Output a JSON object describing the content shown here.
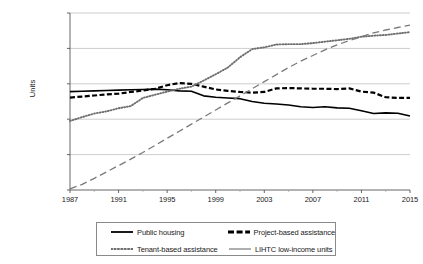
{
  "chart_data": {
    "type": "line",
    "title": "",
    "xlabel": "",
    "ylabel": "Units",
    "xlim": [
      1987,
      2015
    ],
    "ylim": [
      0,
      2500000
    ],
    "grid": "horizontal",
    "legend_position": "bottom",
    "y_ticks": [
      "0",
      "500,000",
      "1,000,000",
      "1,500,000",
      "2,000,000",
      "2,500,000"
    ],
    "y_tick_values": [
      0,
      500000,
      1000000,
      1500000,
      2000000,
      2500000
    ],
    "x_ticks": [
      "1987",
      "1991",
      "1995",
      "1999",
      "2003",
      "2007",
      "2011",
      "2015"
    ],
    "x_tick_values": [
      1987,
      1991,
      1995,
      1999,
      2003,
      2007,
      2011,
      2015
    ],
    "x_minor_tick_values": [
      1989,
      1993,
      1997,
      2001,
      2005,
      2009,
      2013
    ],
    "x": [
      1987,
      1988,
      1989,
      1990,
      1991,
      1992,
      1993,
      1994,
      1995,
      1996,
      1997,
      1998,
      1999,
      2000,
      2001,
      2002,
      2003,
      2004,
      2005,
      2006,
      2007,
      2008,
      2009,
      2010,
      2011,
      2012,
      2013,
      2014,
      2015
    ],
    "series": [
      {
        "name": "Public housing",
        "style": "solid",
        "color": "#000000",
        "values": [
          1390000,
          1395000,
          1400000,
          1405000,
          1410000,
          1415000,
          1420000,
          1425000,
          1415000,
          1400000,
          1395000,
          1330000,
          1310000,
          1300000,
          1290000,
          1250000,
          1225000,
          1215000,
          1200000,
          1175000,
          1165000,
          1175000,
          1160000,
          1155000,
          1120000,
          1080000,
          1090000,
          1085000,
          1045000
        ]
      },
      {
        "name": "Project-based assistance",
        "style": "dashed",
        "color": "#000000",
        "values": [
          1305000,
          1320000,
          1335000,
          1350000,
          1360000,
          1385000,
          1405000,
          1430000,
          1480000,
          1510000,
          1500000,
          1460000,
          1420000,
          1400000,
          1385000,
          1375000,
          1385000,
          1435000,
          1440000,
          1435000,
          1430000,
          1430000,
          1425000,
          1435000,
          1390000,
          1375000,
          1310000,
          1300000,
          1300000
        ]
      },
      {
        "name": "Tenant-based assistance",
        "style": "dotted",
        "color": "#6e6e6e",
        "values": [
          975000,
          1030000,
          1080000,
          1110000,
          1155000,
          1185000,
          1300000,
          1345000,
          1390000,
          1430000,
          1460000,
          1545000,
          1635000,
          1730000,
          1875000,
          1990000,
          2015000,
          2055000,
          2060000,
          2060000,
          2075000,
          2095000,
          2115000,
          2135000,
          2165000,
          2180000,
          2190000,
          2210000,
          2230000
        ]
      },
      {
        "name": "LIHTC low-income units",
        "style": "longdash",
        "color": "#7a7a7a",
        "values": [
          15000,
          80000,
          165000,
          255000,
          345000,
          435000,
          530000,
          630000,
          730000,
          830000,
          930000,
          1030000,
          1130000,
          1230000,
          1330000,
          1430000,
          1530000,
          1630000,
          1730000,
          1820000,
          1900000,
          1980000,
          2050000,
          2110000,
          2165000,
          2220000,
          2260000,
          2295000,
          2330000
        ]
      }
    ]
  },
  "legend": {
    "items": [
      {
        "label": "Public housing"
      },
      {
        "label": "Project-based assistance"
      },
      {
        "label": "Tenant-based assistance"
      },
      {
        "label": "LIHTC low-income units"
      }
    ]
  }
}
